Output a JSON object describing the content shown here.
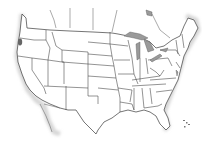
{
  "map": {
    "type": "outline-map",
    "region": "United States (contiguous states)",
    "background_color": "#ffffff",
    "outline_color": "#3a3a3a",
    "lake_color": "#9a9a9a",
    "marker": {
      "location": "Oregon coast",
      "x": 20,
      "y": 42,
      "color": "#666666"
    },
    "labels": []
  }
}
